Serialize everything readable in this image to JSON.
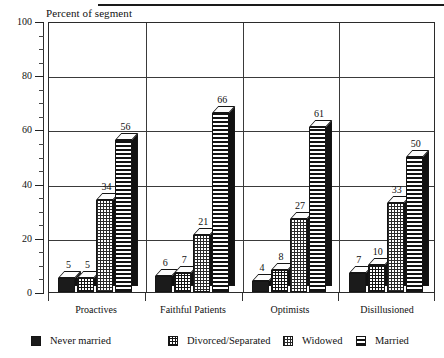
{
  "chart_data": {
    "type": "bar",
    "title": "",
    "ylabel": "Percent of segment",
    "xlabel": "",
    "ylim": [
      0,
      100
    ],
    "yticks": [
      0,
      20,
      40,
      60,
      80,
      100
    ],
    "ytick_labels": [
      "0",
      "20",
      "40",
      "60",
      "80",
      "100"
    ],
    "minor_tick_step": 5,
    "grid": true,
    "legend_position": "bottom",
    "categories": [
      "Proactives",
      "Faithful Patients",
      "Optimists",
      "Disillusioned"
    ],
    "series": [
      {
        "name": "Never married",
        "values": [
          5,
          6,
          4,
          7
        ],
        "pattern": "solid"
      },
      {
        "name": "Divorced/Separated",
        "values": [
          5,
          7,
          8,
          10
        ],
        "pattern": "grid"
      },
      {
        "name": "Widowed",
        "values": [
          34,
          21,
          27,
          33
        ],
        "pattern": "dots"
      },
      {
        "name": "Married",
        "values": [
          56,
          66,
          61,
          50
        ],
        "pattern": "hlines"
      }
    ]
  },
  "axis_title": "Percent of segment",
  "legend": {
    "items": [
      {
        "label": "Never married"
      },
      {
        "label": "Divorced/Separated"
      },
      {
        "label": "Widowed"
      },
      {
        "label": "Married"
      }
    ]
  }
}
